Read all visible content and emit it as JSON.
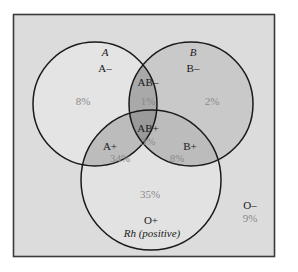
{
  "diagram": {
    "type": "venn",
    "sets": {
      "A": {
        "label": "A"
      },
      "B": {
        "label": "B"
      },
      "Rh": {
        "label": "Rh (positive)"
      }
    },
    "regions": {
      "a_neg": {
        "type": "A–",
        "percent": "8%"
      },
      "b_neg": {
        "type": "B–",
        "percent": "2%"
      },
      "ab_neg": {
        "type": "AB–",
        "percent": "1%"
      },
      "ab_pos": {
        "type": "AB+",
        "percent": "3%"
      },
      "a_pos": {
        "type": "A+",
        "percent": "34%"
      },
      "b_pos": {
        "type": "B+",
        "percent": "8%"
      },
      "o_pos": {
        "type": "O+",
        "percent": "35%"
      },
      "o_neg": {
        "type": "O–",
        "percent": "9%"
      }
    },
    "colors": {
      "universe_fill": "#dcdcdc",
      "universe_border": "#3a3a3a",
      "a_only_fill": "#e4e4e4",
      "b_only_fill": "#c9c9c9",
      "rh_only_fill": "#e2e2e2",
      "pair_overlap_fill": "#bcbcbc",
      "ab_overlap_fill": "#a9a9a9",
      "triple_overlap_fill": "#9a9a9a",
      "circle_stroke": "#1a1a1a"
    }
  }
}
